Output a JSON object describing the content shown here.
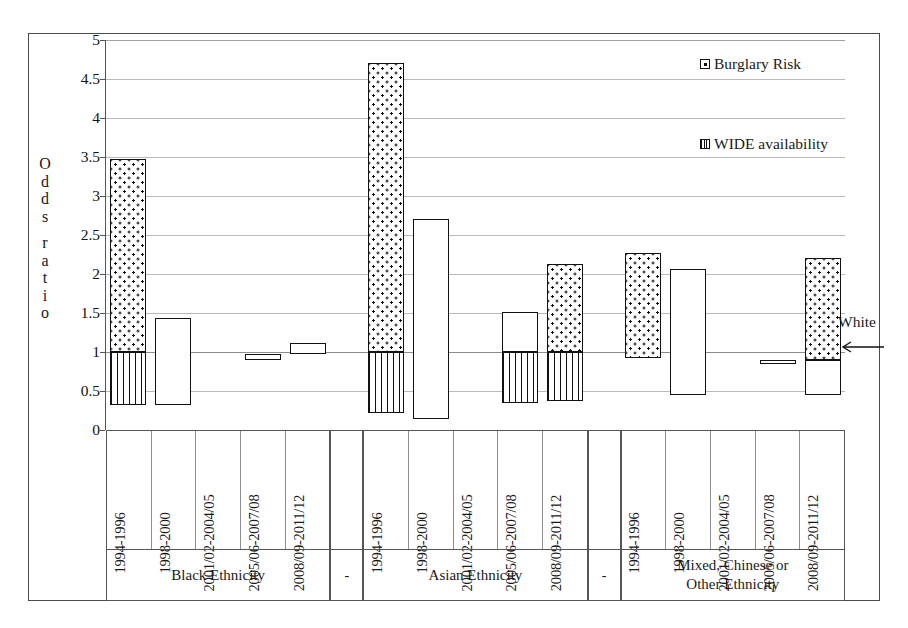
{
  "chart_data": {
    "type": "bar",
    "title": "",
    "subtitle": "",
    "xlabel": "",
    "ylabel": "Odds ratio",
    "ylim": [
      0,
      5
    ],
    "ytick_values": [
      0,
      0.5,
      1,
      1.5,
      2,
      2.5,
      3,
      3.5,
      4,
      4.5,
      5
    ],
    "ytick_labels": [
      "0",
      "0.5",
      "1",
      "1.5",
      "2",
      "2.5",
      "3",
      "3.5",
      "4",
      "4.5",
      "5"
    ],
    "grid": true,
    "reference_line": {
      "value": 1,
      "label": "White"
    },
    "legend": {
      "position": "top-right",
      "entries": [
        {
          "name": "Burglary Risk",
          "pattern": "dotted"
        },
        {
          "name": "WIDE availability",
          "pattern": "vertical-stripes"
        }
      ]
    },
    "categories": [
      "1994-1996",
      "1998-2000",
      "2001/02-2004/05",
      "2005/06-2007/08",
      "2008/09-2011/12"
    ],
    "groups": [
      {
        "name": "Black Ethnicity",
        "bars": [
          {
            "category": "1994-1996",
            "risk_top": 3.48,
            "risk_bottom": 1.0,
            "wide_top": 1.0,
            "wide_bottom": 0.32,
            "plain_top": null,
            "plain_bottom": null
          },
          {
            "category": "1998-2000",
            "risk_top": null,
            "risk_bottom": null,
            "wide_top": null,
            "wide_bottom": null,
            "plain_top": 1.43,
            "plain_bottom": 0.32
          },
          {
            "category": "2001/02-2004/05",
            "risk_top": null,
            "risk_bottom": null,
            "wide_top": null,
            "wide_bottom": null,
            "plain_top": null,
            "plain_bottom": null
          },
          {
            "category": "2005/06-2007/08",
            "risk_top": null,
            "risk_bottom": null,
            "wide_top": null,
            "wide_bottom": null,
            "plain_top": 0.97,
            "plain_bottom": 0.9
          },
          {
            "category": "2008/09-2011/12",
            "risk_top": null,
            "risk_bottom": null,
            "wide_top": null,
            "wide_bottom": null,
            "plain_top": 1.12,
            "plain_bottom": 0.97
          }
        ]
      },
      {
        "name": "Asian Ethnicity",
        "bars": [
          {
            "category": "1994-1996",
            "risk_top": 4.7,
            "risk_bottom": 1.0,
            "wide_top": 1.0,
            "wide_bottom": 0.22,
            "plain_top": null,
            "plain_bottom": null
          },
          {
            "category": "1998-2000",
            "risk_top": null,
            "risk_bottom": null,
            "wide_top": null,
            "wide_bottom": null,
            "plain_top": 2.7,
            "plain_bottom": 0.14
          },
          {
            "category": "2001/02-2004/05",
            "risk_top": null,
            "risk_bottom": null,
            "wide_top": null,
            "wide_bottom": null,
            "plain_top": null,
            "plain_bottom": null
          },
          {
            "category": "2005/06-2007/08",
            "risk_top": null,
            "risk_bottom": null,
            "wide_top": 1.0,
            "wide_bottom": 0.35,
            "plain_top": 1.51,
            "plain_bottom": 1.0
          },
          {
            "category": "2008/09-2011/12",
            "risk_top": 2.13,
            "risk_bottom": 1.0,
            "wide_top": 1.0,
            "wide_bottom": 0.37,
            "plain_top": null,
            "plain_bottom": null
          }
        ]
      },
      {
        "name": "Mixed, Chinese or Other Ethnicity",
        "bars": [
          {
            "category": "1994-1996",
            "risk_top": 2.27,
            "risk_bottom": 0.92,
            "wide_top": null,
            "wide_bottom": null,
            "plain_top": null,
            "plain_bottom": null
          },
          {
            "category": "1998-2000",
            "risk_top": null,
            "risk_bottom": null,
            "wide_top": null,
            "wide_bottom": null,
            "plain_top": 2.06,
            "plain_bottom": 0.45
          },
          {
            "category": "2001/02-2004/05",
            "risk_top": null,
            "risk_bottom": null,
            "wide_top": null,
            "wide_bottom": null,
            "plain_top": null,
            "plain_bottom": null
          },
          {
            "category": "2005/06-2007/08",
            "risk_top": null,
            "risk_bottom": null,
            "wide_top": null,
            "wide_bottom": null,
            "plain_top": 0.9,
            "plain_bottom": 0.84
          },
          {
            "category": "2008/09-2011/12",
            "risk_top": 2.2,
            "risk_bottom": 0.9,
            "wide_top": null,
            "wide_bottom": null,
            "plain_top": 0.9,
            "plain_bottom": 0.45
          }
        ]
      }
    ],
    "separators": [
      "-",
      "-"
    ]
  },
  "axis": {
    "ylabel_chars": [
      "O",
      "d",
      "d",
      "s",
      "",
      "r",
      "a",
      "t",
      "i",
      "o"
    ]
  },
  "annotations": {
    "white_label": "White",
    "white_arrow_icon": "left-arrow-icon"
  },
  "colors": {
    "ink": "#111111",
    "grid": "#b9b9b9",
    "frame": "#4a4a4a"
  }
}
